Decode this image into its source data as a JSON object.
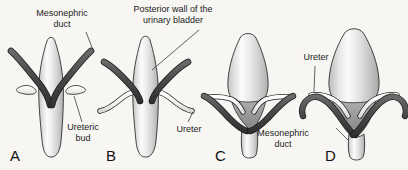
{
  "figure": {
    "background_color": "#f8f6f3",
    "colors": {
      "bladder_light": "#fafafa",
      "bladder_mid": "#d8d8d8",
      "bladder_shadow": "#b4b4b4",
      "mesonephric_duct": "#4a4a4a",
      "mesonephric_duct_dark": "#2e2e2e",
      "ureter_white": "#f2f2f0",
      "trigone_gray": "#9a9a9a",
      "outline": "#1a1a1a",
      "label_text": "#1b1b1b",
      "leader_line": "#3a3a3a"
    }
  },
  "labels": {
    "mesonephric_duct_top_line1": "Mesonephric",
    "mesonephric_duct_top_line2": "duct",
    "posterior_wall_line1": "Posterior wall of the",
    "posterior_wall_line2": "urinary bladder",
    "ureteric_bud_line1": "Ureteric",
    "ureteric_bud_line2": "bud",
    "ureter_b": "Ureter",
    "ureter_d": "Ureter",
    "mesonephric_duct_cd_line1": "Mesonephric",
    "mesonephric_duct_cd_line2": "duct"
  },
  "panels": [
    {
      "letter": "A",
      "name": "panel-a",
      "stage": "Ureteric buds arise from the mesonephric ducts",
      "structures": [
        "posterior wall of urinary bladder",
        "mesonephric duct",
        "ureteric bud"
      ]
    },
    {
      "letter": "B",
      "name": "panel-b",
      "stage": "Ureters elongate and mesonephric ducts approach the bladder",
      "structures": [
        "posterior wall of urinary bladder",
        "mesonephric duct",
        "ureter"
      ]
    },
    {
      "letter": "C",
      "name": "panel-c",
      "stage": "Mesonephric ducts are absorbed into the bladder wall forming the trigone",
      "structures": [
        "trigone",
        "mesonephric duct",
        "ureter"
      ]
    },
    {
      "letter": "D",
      "name": "panel-d",
      "stage": "Ureters open separately, mesonephric ducts shift inferiorly",
      "structures": [
        "trigone",
        "mesonephric duct",
        "ureter"
      ]
    }
  ]
}
